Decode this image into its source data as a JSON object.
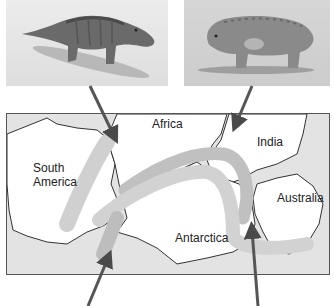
{
  "figure": {
    "top_panels": [
      {
        "subject": "reptile-fossil-animal-left",
        "description": "lizard-like reptile with tail"
      },
      {
        "subject": "reptile-fossil-animal-right",
        "description": "stout hippo-like reptile"
      }
    ],
    "map": {
      "labels": {
        "africa": "Africa",
        "india": "India",
        "south_america": "South America",
        "south_america_line1": "South",
        "south_america_line2": "America",
        "australia": "Australia",
        "antarctica": "Antarctica"
      },
      "colors": {
        "ocean": "#e3e3e3",
        "land": "#ffffff",
        "coastline": "#333333",
        "fossil_band_light": "#d2d2d2",
        "fossil_band_dark": "#bdbdbd",
        "arrow": "#555555"
      }
    },
    "arrows": [
      {
        "from": "left-animal",
        "to": "africa-band"
      },
      {
        "from": "right-animal",
        "to": "india-band"
      },
      {
        "from": "bottom-left",
        "to": "south-america-antarctica-band"
      },
      {
        "from": "bottom-right",
        "to": "antarctica-australia-band"
      }
    ]
  }
}
